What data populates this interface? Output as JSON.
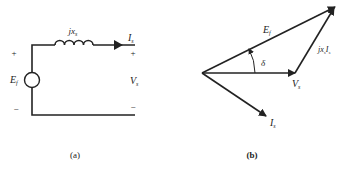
{
  "figure_a": {
    "caption": "(a)",
    "reactance_label": "jx",
    "reactance_sub": "s",
    "current_label": "I",
    "current_sub": "s",
    "source_label": "E",
    "source_sub": "f",
    "terminal_voltage_label": "V",
    "terminal_voltage_sub": "s",
    "plus_left": "+",
    "minus_left": "−",
    "plus_right": "+",
    "minus_right": "−"
  },
  "figure_b": {
    "caption": "(b)",
    "ef_label": "E",
    "ef_sub": "f",
    "vs_label": "V",
    "vs_sub": "s",
    "is_label": "I",
    "is_sub": "s",
    "drop_label": "jx",
    "drop_sub": "s",
    "drop_label2": "I",
    "drop_sub2": "s",
    "angle_label": "δ"
  },
  "colors": {
    "line": "#222222",
    "background": "#ffffff"
  }
}
